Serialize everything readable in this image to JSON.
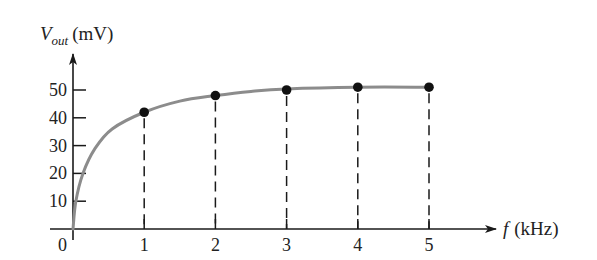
{
  "chart_data": {
    "type": "line",
    "title": "",
    "ylabel": "V_out (mV)",
    "ylabel_main": "V",
    "ylabel_sub": "out",
    "ylabel_unit": "(mV)",
    "xlabel": "f (kHz)",
    "xlabel_main": "f",
    "xlabel_unit": "(kHz)",
    "x_ticks": [
      "1",
      "2",
      "3",
      "4",
      "5"
    ],
    "y_ticks": [
      "10",
      "20",
      "30",
      "40",
      "50"
    ],
    "origin_label": "0",
    "xlim": [
      0,
      6
    ],
    "ylim": [
      0,
      60
    ],
    "grid": false,
    "legend": null,
    "series": [
      {
        "name": "V_out",
        "x": [
          1,
          2,
          3,
          4,
          5
        ],
        "values": [
          42,
          48,
          50,
          51,
          51
        ],
        "marker": "filled-circle",
        "drop_lines": "dashed"
      }
    ],
    "curve": {
      "description": "smooth saturating curve from origin through data points",
      "x": [
        0,
        0.04,
        0.14,
        0.31,
        0.55,
        1,
        1.5,
        2,
        2.5,
        3,
        4,
        5
      ],
      "values": [
        0,
        10,
        20,
        29,
        36,
        42,
        46,
        48,
        49.5,
        50.4,
        51,
        51
      ]
    },
    "colors": {
      "curve": "#8c8c8c",
      "axes": "#1a1a1a",
      "points": "#111111"
    }
  }
}
